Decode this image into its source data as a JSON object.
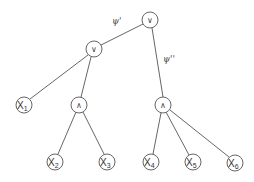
{
  "diagram": {
    "type": "tree",
    "nodes": {
      "root": {
        "label": "∨",
        "kind": "or"
      },
      "or_left": {
        "label": "∨",
        "kind": "or"
      },
      "and_left": {
        "label": "∧",
        "kind": "and"
      },
      "and_right": {
        "label": "∧",
        "kind": "and"
      },
      "x1": {
        "label": "X",
        "sub": "1"
      },
      "x2": {
        "label": "X",
        "sub": "2"
      },
      "x3": {
        "label": "X",
        "sub": "3"
      },
      "x4": {
        "label": "X",
        "sub": "4"
      },
      "x5": {
        "label": "X",
        "sub": "5"
      },
      "x6": {
        "label": "X",
        "sub": "6"
      }
    },
    "edge_labels": {
      "psi_prime": "ψ'",
      "psi_double_prime": "ψ''"
    },
    "edges": [
      [
        "root",
        "or_left"
      ],
      [
        "root",
        "and_right"
      ],
      [
        "or_left",
        "x1"
      ],
      [
        "or_left",
        "and_left"
      ],
      [
        "and_left",
        "x2"
      ],
      [
        "and_left",
        "x3"
      ],
      [
        "and_right",
        "x4"
      ],
      [
        "and_right",
        "x5"
      ],
      [
        "and_right",
        "x6"
      ]
    ]
  }
}
